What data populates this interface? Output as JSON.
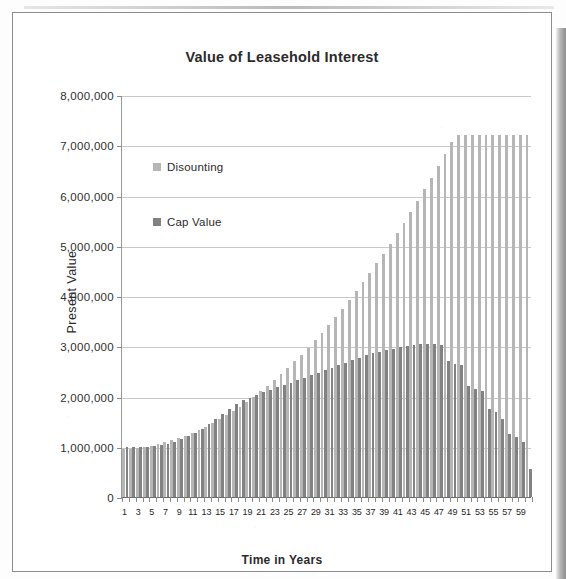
{
  "chart_data": {
    "type": "bar",
    "title": "Value of Leasehold Interest",
    "xlabel": "Time in Years",
    "ylabel": "Present Value",
    "ylim": [
      0,
      8000000
    ],
    "y_ticks": [
      0,
      1000000,
      2000000,
      3000000,
      4000000,
      5000000,
      6000000,
      7000000,
      8000000
    ],
    "y_tick_labels": [
      "0",
      "1,000,000",
      "2,000,000",
      "3,000,000",
      "4,000,000",
      "5,000,000",
      "6,000,000",
      "7,000,000",
      "8,000,000"
    ],
    "grid": true,
    "legend_position": "inside-upper-left",
    "x": [
      1,
      2,
      3,
      4,
      5,
      6,
      7,
      8,
      9,
      10,
      11,
      12,
      13,
      14,
      15,
      16,
      17,
      18,
      19,
      20,
      21,
      22,
      23,
      24,
      25,
      26,
      27,
      28,
      29,
      30,
      31,
      32,
      33,
      34,
      35,
      36,
      37,
      38,
      39,
      40,
      41,
      42,
      43,
      44,
      45,
      46,
      47,
      48,
      49,
      50,
      51,
      52,
      53,
      54,
      55,
      56,
      57,
      58,
      59,
      60
    ],
    "x_tick_labels": [
      "1",
      "3",
      "5",
      "7",
      "9",
      "11",
      "13",
      "15",
      "17",
      "19",
      "21",
      "23",
      "25",
      "27",
      "29",
      "31",
      "33",
      "35",
      "37",
      "39",
      "41",
      "43",
      "45",
      "47",
      "49",
      "51",
      "53",
      "55",
      "57",
      "59"
    ],
    "series": [
      {
        "name": "Disounting",
        "color": "#b6b6b6",
        "values": [
          950000,
          960000,
          975000,
          995000,
          1020000,
          1050000,
          1085000,
          1125000,
          1170000,
          1220000,
          1275000,
          1335000,
          1400000,
          1470000,
          1545000,
          1625000,
          1710000,
          1800000,
          1895000,
          1995000,
          2100000,
          2210000,
          2325000,
          2445000,
          2570000,
          2700000,
          2835000,
          2975000,
          3120000,
          3270000,
          3425000,
          3585000,
          3750000,
          3920000,
          4095000,
          4275000,
          4460000,
          4650000,
          4845000,
          5045000,
          5250000,
          5460000,
          5675000,
          5895000,
          6120000,
          6350000,
          6585000,
          6825000,
          7070000,
          7200000,
          7200000,
          7200000,
          7200000,
          7200000,
          7200000,
          7200000,
          7200000,
          7200000,
          7200000,
          7200000
        ]
      },
      {
        "name": "Cap Value",
        "color": "#828282",
        "values": [
          1000000,
          1000000,
          1000000,
          1000000,
          1010000,
          1030000,
          1060000,
          1100000,
          1150000,
          1210000,
          1280000,
          1360000,
          1450000,
          1545000,
          1645000,
          1750000,
          1860000,
          1925000,
          1980000,
          2030000,
          2080000,
          2130000,
          2180000,
          2225000,
          2270000,
          2320000,
          2370000,
          2420000,
          2470000,
          2520000,
          2570000,
          2620000,
          2670000,
          2720000,
          2770000,
          2820000,
          2860000,
          2895000,
          2925000,
          2955000,
          2985000,
          3010000,
          3030000,
          3045000,
          3050000,
          3045000,
          3030000,
          2700000,
          2650000,
          2620000,
          2200000,
          2150000,
          2100000,
          1750000,
          1700000,
          1550000,
          1250000,
          1200000,
          1100000,
          560000
        ]
      }
    ]
  },
  "chart": {
    "title": "Value of Leasehold Interest",
    "x_axis_title": "Time in Years",
    "y_axis_title": "Present Value"
  },
  "legend": {
    "entries": [
      {
        "label": "Disounting",
        "color": "#b6b6b6"
      },
      {
        "label": "Cap Value",
        "color": "#828282"
      }
    ]
  }
}
